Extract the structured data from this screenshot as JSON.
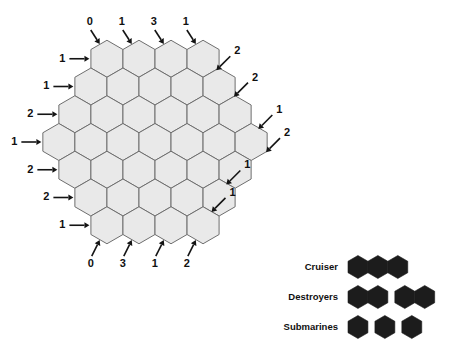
{
  "figure": {
    "type": "puzzle-board",
    "title": "",
    "background_color": "#ffffff"
  },
  "board": {
    "name": "hex-battleship-grid",
    "orientation": "pointy-top",
    "row_counts": [
      4,
      5,
      6,
      7,
      6,
      5,
      4
    ],
    "total_cells": 37,
    "cell_fill": "#e9e9e9",
    "cell_stroke": "#6e6e6e",
    "geometry": {
      "center_x": 155,
      "center_y": 142,
      "hex_radius": 18.5,
      "hex_width": 32,
      "row_step": 27.75
    }
  },
  "clues": {
    "top": {
      "label": "top-edge-clues",
      "values": [
        "0",
        "1",
        "3",
        "1"
      ]
    },
    "left": {
      "label": "left-edge-clues",
      "values": [
        "1",
        "1",
        "2",
        "1",
        "2",
        "2",
        "1"
      ]
    },
    "right": {
      "label": "right-edge-clues",
      "values": [
        "2",
        "2",
        "1",
        "2",
        "1",
        "1"
      ]
    },
    "bottom": {
      "label": "bottom-edge-clues",
      "values": [
        "0",
        "3",
        "1",
        "2"
      ]
    }
  },
  "legend": {
    "name": "fleet-legend",
    "marker_color": "#1c1c1c",
    "rows": [
      {
        "label": "Cruiser",
        "groups": [
          3
        ]
      },
      {
        "label": "Destroyers",
        "groups": [
          2,
          2
        ]
      },
      {
        "label": "Submarines",
        "groups": [
          1,
          1,
          1
        ]
      }
    ]
  }
}
